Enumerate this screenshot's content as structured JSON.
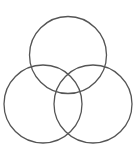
{
  "diagram": {
    "type": "venn",
    "stroke_color": "#555555",
    "stroke_width": 1.3,
    "circles": [
      {
        "name": "top",
        "cx": 68,
        "cy": 55,
        "r": 38.5
      },
      {
        "name": "left",
        "cx": 43,
        "cy": 104,
        "r": 39
      },
      {
        "name": "right",
        "cx": 93,
        "cy": 104,
        "r": 39
      }
    ],
    "caption": ""
  }
}
